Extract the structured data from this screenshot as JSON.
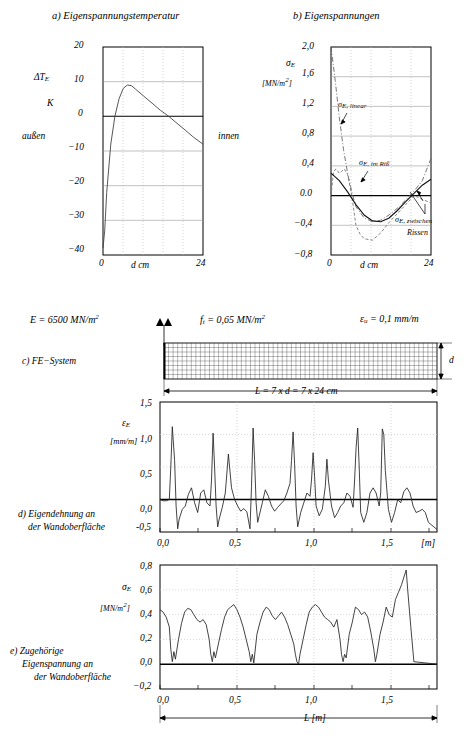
{
  "figure": {
    "language": "de",
    "panels": {
      "a": {
        "title": "a) Eigenspannungstemperatur",
        "ylabel1": "ΔT",
        "ylabel1_sub": "E",
        "ylabel2": "K",
        "left_note": "außen",
        "right_note": "innen",
        "xlabel": "d  cm",
        "yticks": [
          "20",
          "10",
          "0",
          "−10",
          "−20",
          "−30",
          "−40"
        ],
        "xticks": [
          "0",
          "24"
        ]
      },
      "b": {
        "title": "b) Eigenspannungen",
        "ylabel1": "σ",
        "ylabel1_sub": "E",
        "ylabel2": "[MN/m",
        "ylabel2_sup": "2",
        "ylabel2_end": "]",
        "xlabel": "d  cm",
        "yticks": [
          "2,0",
          "1,6",
          "1,2",
          "0,8",
          "0,4",
          "0.0",
          "−0,4",
          "−0,8"
        ],
        "xticks": [
          "0",
          "24"
        ],
        "curve_labels": [
          {
            "text": "σ",
            "sub": "E, linear"
          },
          {
            "text": "σ",
            "sub": "E, im Riß"
          },
          {
            "text": "σ",
            "sub": "E, zwischen",
            "line2": "Rissen"
          }
        ]
      },
      "c": {
        "caption": "c) FE−System",
        "params": [
          {
            "sym": "E",
            "eq": "= 6500 MN/m",
            "sup": "2"
          },
          {
            "sym": "f",
            "sub": "t",
            "eq": "= 0,65 MN/m",
            "sup": "2"
          },
          {
            "sym": "ε",
            "sub": "u",
            "eq": "= 0,1 mm/m"
          }
        ],
        "height_label": "d",
        "length_label": "L = 7 x d = 7 x 24 cm"
      },
      "d": {
        "caption_line1": "d) Eigendehnung an",
        "caption_line2": "der Wandoberfläche",
        "ylabel1": "ε",
        "ylabel1_sub": "E",
        "ylabel2": "[mm/m]",
        "yticks": [
          "1,5",
          "1,0",
          "0,5",
          "0,0",
          "-0,5"
        ],
        "xticks": [
          "0,0",
          "0,5",
          "1,0",
          "1,5"
        ],
        "xunit": "[m]"
      },
      "e": {
        "caption_line1": "e) Zugehörige",
        "caption_line2": "Eigenspannung an",
        "caption_line3": "der Wandoberfläche",
        "ylabel1": "σ",
        "ylabel1_sub": "E",
        "ylabel2": "[MN/m",
        "ylabel2_sup": "2",
        "ylabel2_end": "]",
        "yticks": [
          "0,8",
          "0,6",
          "0,4",
          "0,2",
          "0,0",
          "−0,2"
        ],
        "xticks": [
          "0,0",
          "0,5",
          "1,0",
          "1,5"
        ],
        "length_label": "L  [m]"
      }
    }
  },
  "chart_data": [
    {
      "id": "a",
      "type": "line",
      "title": "a) Eigenspannungstemperatur",
      "xlabel": "d  cm",
      "ylabel": "ΔT_E  K",
      "xlim": [
        0,
        24
      ],
      "ylim": [
        -40,
        20
      ],
      "grid": true,
      "series": [
        {
          "name": "ΔT_E",
          "x": [
            0,
            0.4,
            1,
            2,
            3,
            4,
            5,
            6,
            7,
            8,
            10,
            12,
            14,
            16,
            18,
            20,
            22,
            24
          ],
          "y": [
            -38,
            -33,
            -22,
            -8,
            0,
            5,
            8,
            9.2,
            9,
            8,
            6,
            4,
            2,
            0,
            -2,
            -4,
            -6,
            -8
          ]
        }
      ]
    },
    {
      "id": "b",
      "type": "line",
      "title": "b) Eigenspannungen",
      "xlabel": "d  cm",
      "ylabel": "σ_E  [MN/m2]",
      "xlim": [
        0,
        24
      ],
      "ylim": [
        -0.8,
        2.0
      ],
      "grid": true,
      "series": [
        {
          "name": "σ_E, linear",
          "style": "dash-dot",
          "x": [
            0,
            1,
            2,
            3,
            4,
            5,
            6,
            8,
            10,
            12,
            14,
            16,
            18,
            20,
            22,
            24
          ],
          "y": [
            2.0,
            1.55,
            1.05,
            0.62,
            0.3,
            0.05,
            -0.15,
            -0.3,
            -0.35,
            -0.33,
            -0.26,
            -0.17,
            -0.06,
            0.06,
            0.2,
            0.5
          ]
        },
        {
          "name": "σ_E, im Riß",
          "style": "dashed",
          "x": [
            0,
            0.6,
            1.2,
            2,
            2.6,
            3.2,
            4,
            5,
            6,
            7,
            8,
            10,
            12,
            14,
            16,
            18,
            20,
            22,
            24
          ],
          "y": [
            0.0,
            0.32,
            0.36,
            0.3,
            0.33,
            0.36,
            0.28,
            0.0,
            -0.4,
            -0.52,
            -0.58,
            -0.6,
            -0.5,
            -0.36,
            -0.24,
            -0.12,
            0.0,
            -0.05,
            -0.1
          ]
        },
        {
          "name": "σ_E, zwischen Rissen",
          "style": "solid",
          "x": [
            0,
            2,
            4,
            6,
            8,
            10,
            12,
            14,
            16,
            18,
            20,
            22,
            24
          ],
          "y": [
            0.3,
            0.2,
            0.05,
            -0.12,
            -0.26,
            -0.34,
            -0.35,
            -0.3,
            -0.2,
            -0.08,
            0.03,
            0.14,
            0.22
          ]
        }
      ]
    },
    {
      "id": "d",
      "type": "line",
      "title": "d) Eigendehnung an der Wandoberfläche",
      "xlabel": "[m]",
      "ylabel": "ε_E  [mm/m]",
      "xlim": [
        -0.06,
        1.74
      ],
      "ylim": [
        -0.5,
        1.5
      ],
      "grid": true,
      "note": "oscillating strain with sharp crack peaks approx every 0.24 m",
      "series": [
        {
          "name": "ε_E",
          "x": [
            -0.06,
            -0.04,
            -0.02,
            0.0,
            0.01,
            0.02,
            0.03,
            0.04,
            0.05,
            0.06,
            0.08,
            0.1,
            0.12,
            0.14,
            0.16,
            0.18,
            0.2,
            0.22,
            0.24,
            0.26,
            0.27,
            0.28,
            0.29,
            0.3,
            0.31,
            0.32,
            0.34,
            0.36,
            0.38,
            0.4,
            0.42,
            0.44,
            0.46,
            0.48,
            0.5,
            0.51,
            0.52,
            0.53,
            0.54,
            0.55,
            0.56,
            0.58,
            0.6,
            0.62,
            0.64,
            0.66,
            0.68,
            0.7,
            0.72,
            0.74,
            0.76,
            0.78,
            0.79,
            0.8,
            0.81,
            0.82,
            0.84,
            0.86,
            0.88,
            0.9,
            0.92,
            0.93,
            0.94,
            0.95,
            0.96,
            0.98,
            1.0,
            1.02,
            1.04,
            1.05,
            1.06,
            1.08,
            1.1,
            1.12,
            1.14,
            1.16,
            1.18,
            1.2,
            1.22,
            1.23,
            1.24,
            1.25,
            1.26,
            1.28,
            1.3,
            1.32,
            1.34,
            1.36,
            1.38,
            1.4,
            1.41,
            1.42,
            1.43,
            1.44,
            1.46,
            1.48,
            1.5,
            1.52,
            1.54,
            1.56,
            1.58,
            1.6,
            1.62,
            1.64,
            1.66,
            1.68,
            1.7,
            1.72
          ],
          "y": [
            0.0,
            -0.02,
            -0.02,
            0.0,
            0.5,
            1.12,
            0.6,
            -0.1,
            -0.45,
            -0.3,
            -0.15,
            -0.1,
            0.08,
            0.18,
            -0.05,
            -0.2,
            0.1,
            0.15,
            -0.05,
            -0.1,
            0.3,
            1.02,
            0.5,
            -0.1,
            -0.42,
            -0.3,
            -0.12,
            0.1,
            0.18,
            0.05,
            -0.1,
            -0.18,
            -0.14,
            -0.2,
            -0.45,
            0.2,
            1.1,
            0.6,
            -0.05,
            -0.35,
            -0.25,
            -0.05,
            0.15,
            0.05,
            -0.1,
            -0.18,
            -0.12,
            -0.08,
            -0.05,
            0.0,
            0.1,
            0.25,
            0.6,
            1.04,
            0.55,
            -0.1,
            -0.42,
            -0.2,
            -0.05,
            0.1,
            0.05,
            0.3,
            0.72,
            0.35,
            -0.1,
            -0.25,
            -0.15,
            0.2,
            0.62,
            0.3,
            -0.1,
            -0.28,
            -0.2,
            -0.1,
            -0.05,
            0.1,
            0.02,
            -0.12,
            0.3,
            0.8,
            1.02,
            0.5,
            -0.2,
            -0.35,
            -0.2,
            0.05,
            0.14,
            0.05,
            -0.1,
            0.1,
            0.6,
            1.0,
            0.45,
            -0.15,
            -0.35,
            -0.2,
            0.0,
            -0.05,
            0.12,
            0.18,
            0.1,
            -0.1,
            -0.2,
            -0.18,
            -0.15,
            -0.2,
            -0.35
          ]
        }
      ]
    },
    {
      "id": "e",
      "type": "line",
      "title": "e) Zugehörige Eigenspannung an der Wandoberfläche",
      "xlabel": "L  [m]",
      "ylabel": "σ_E  [MN/m2]",
      "xlim": [
        -0.06,
        1.74
      ],
      "ylim": [
        -0.2,
        0.8
      ],
      "grid": true,
      "note": "stress drops to zero at each crack location",
      "series": [
        {
          "name": "σ_E",
          "x": [
            -0.06,
            -0.04,
            -0.02,
            0.0,
            0.01,
            0.02,
            0.03,
            0.04,
            0.06,
            0.08,
            0.1,
            0.12,
            0.14,
            0.16,
            0.18,
            0.2,
            0.22,
            0.24,
            0.26,
            0.27,
            0.28,
            0.29,
            0.3,
            0.32,
            0.34,
            0.36,
            0.38,
            0.4,
            0.42,
            0.44,
            0.46,
            0.48,
            0.5,
            0.51,
            0.52,
            0.53,
            0.54,
            0.56,
            0.58,
            0.6,
            0.62,
            0.64,
            0.66,
            0.68,
            0.7,
            0.72,
            0.74,
            0.76,
            0.78,
            0.79,
            0.8,
            0.81,
            0.82,
            0.84,
            0.86,
            0.88,
            0.9,
            0.92,
            0.94,
            0.95,
            0.96,
            0.97,
            0.98,
            1.0,
            1.02,
            1.04,
            1.06,
            1.08,
            1.1,
            1.12,
            1.14,
            1.16,
            1.18,
            1.2,
            1.22,
            1.23,
            1.24,
            1.25,
            1.26,
            1.28,
            1.3,
            1.32,
            1.34,
            1.36,
            1.38,
            1.4,
            1.42,
            1.44,
            1.45,
            1.46,
            1.48,
            1.5,
            1.52,
            1.54,
            1.56,
            1.58,
            1.6,
            1.62,
            1.64,
            1.65,
            1.66,
            1.68,
            1.7,
            1.72
          ],
          "y": [
            0.44,
            0.42,
            0.38,
            0.3,
            0.12,
            0.02,
            0.1,
            0.04,
            0.2,
            0.33,
            0.42,
            0.45,
            0.44,
            0.4,
            0.36,
            0.34,
            0.36,
            0.32,
            0.2,
            0.08,
            0.02,
            0.1,
            0.05,
            0.18,
            0.3,
            0.38,
            0.42,
            0.44,
            0.45,
            0.42,
            0.36,
            0.25,
            0.1,
            0.02,
            0.08,
            0.01,
            0.1,
            0.25,
            0.35,
            0.42,
            0.45,
            0.43,
            0.38,
            0.34,
            0.37,
            0.4,
            0.35,
            0.28,
            0.18,
            0.08,
            0.02,
            0.1,
            0.06,
            0.18,
            0.3,
            0.37,
            0.38,
            0.36,
            0.3,
            0.18,
            0.06,
            0.0,
            0.08,
            0.22,
            0.34,
            0.4,
            0.42,
            0.4,
            0.36,
            0.32,
            0.3,
            0.28,
            0.25,
            0.3,
            0.22,
            0.1,
            0.02,
            0.08,
            0.05,
            0.18,
            0.3,
            0.36,
            0.34,
            0.3,
            0.32,
            0.3,
            0.22,
            0.1,
            0.02,
            0.08,
            0.2,
            0.3,
            0.36,
            0.32,
            0.3,
            0.38,
            0.45,
            0.52,
            0.62,
            0.66,
            0.5,
            0.2,
            0.02,
            0.0
          ]
        }
      ]
    }
  ]
}
